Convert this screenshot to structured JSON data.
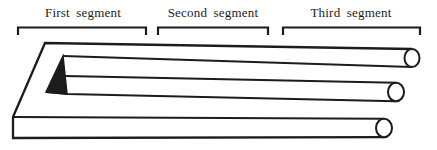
{
  "figure": {
    "background_color": "#ffffff",
    "ink_color": "#1c1c1c",
    "segments": [
      {
        "label": "First segment"
      },
      {
        "label": "Second segment"
      },
      {
        "label": "Third segment"
      }
    ]
  }
}
